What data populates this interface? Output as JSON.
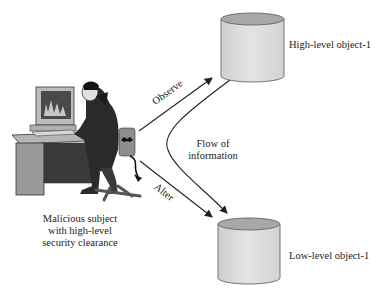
{
  "subject": {
    "caption_lines": [
      "Malicious subject",
      "with high-level",
      "security clearance"
    ]
  },
  "objects": {
    "high": {
      "label": "High-level object-1"
    },
    "low": {
      "label": "Low-level object-1"
    }
  },
  "arrows": {
    "observe": "Observe",
    "alter": "Alter",
    "flow_lines": [
      "Flow of",
      "information"
    ]
  },
  "colors": {
    "cylinder_side": "#dcdcdc",
    "cylinder_top": "#a6a6a6",
    "line": "#222222"
  }
}
